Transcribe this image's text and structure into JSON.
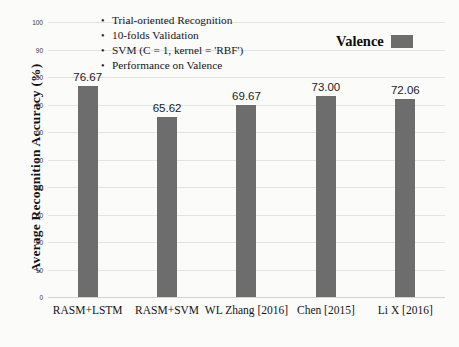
{
  "chart_data": {
    "type": "bar",
    "title": "",
    "xlabel": "",
    "ylabel": "Average Recognition Accuracy (%)",
    "ylim": [
      0,
      100
    ],
    "ytick_step": 10,
    "yticks": [
      "0",
      "10",
      "20",
      "30",
      "40",
      "50",
      "60",
      "70",
      "80",
      "90",
      "100"
    ],
    "grid": true,
    "legend_position": "top-right",
    "categories": [
      "RASM+LSTM",
      "RASM+SVM",
      "WL Zhang [2016]",
      "Chen [2015]",
      "Li X [2016]"
    ],
    "values": [
      76.67,
      65.62,
      69.67,
      73.0,
      72.06
    ],
    "data_labels": [
      "76.67",
      "65.62",
      "69.67",
      "73.00",
      "72.06"
    ],
    "series": [
      {
        "name": "Valence",
        "color": "#6e6d6d",
        "values": [
          76.67,
          65.62,
          69.67,
          73.0,
          72.06
        ]
      }
    ],
    "annotations": [
      "Trial-oriented Recognition",
      "10-folds Validation",
      "SVM (C = 1, kernel = 'RBF')",
      "Performance on Valence"
    ]
  },
  "legend": {
    "label": "Valence",
    "swatch_color": "#6e6d6d"
  },
  "colors": {
    "bar": "#6e6d6d",
    "gridline": "#e3e3e3",
    "background": "#fbfbfa",
    "text": "#161616"
  },
  "bullet_glyph": "•"
}
